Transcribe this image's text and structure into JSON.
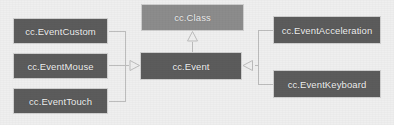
{
  "diagram": {
    "type": "uml-class-diagram",
    "background_color": "#efefef",
    "node_fill_dark": "#5c5c5c",
    "node_fill_light": "#8c8c8c",
    "node_text_color": "#f2f2f2",
    "connector_color": "#bdbdbd"
  },
  "nodes": {
    "event_custom": {
      "label": "cc.EventCustom"
    },
    "event_mouse": {
      "label": "cc.EventMouse"
    },
    "event_touch": {
      "label": "cc.EventTouch"
    },
    "cc_class": {
      "label": "cc.Class"
    },
    "cc_event": {
      "label": "cc.Event"
    },
    "event_acceleration": {
      "label": "cc.EventAcceleration"
    },
    "event_keyboard": {
      "label": "cc.EventKeyboard"
    }
  },
  "relationships": [
    {
      "from": "cc.EventCustom",
      "to": "cc.Event",
      "kind": "generalization"
    },
    {
      "from": "cc.EventMouse",
      "to": "cc.Event",
      "kind": "generalization"
    },
    {
      "from": "cc.EventTouch",
      "to": "cc.Event",
      "kind": "generalization"
    },
    {
      "from": "cc.EventAcceleration",
      "to": "cc.Event",
      "kind": "generalization"
    },
    {
      "from": "cc.EventKeyboard",
      "to": "cc.Event",
      "kind": "generalization"
    },
    {
      "from": "cc.Event",
      "to": "cc.Class",
      "kind": "generalization"
    }
  ]
}
